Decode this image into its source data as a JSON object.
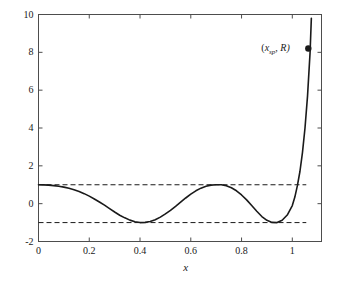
{
  "chart_data": {
    "type": "line",
    "title": "",
    "subtitle": "",
    "xlabel": "x",
    "ylabel": "",
    "xlim": [
      0,
      1.115
    ],
    "ylim": [
      -2,
      10
    ],
    "grid": false,
    "legend": null,
    "xticks": [
      0,
      0.2,
      0.4,
      0.6,
      0.8,
      1
    ],
    "xtick_labels": [
      "0",
      "0.2",
      "0.4",
      "0.6",
      "0.8",
      "1"
    ],
    "yticks": [
      -2,
      0,
      2,
      4,
      6,
      8,
      10
    ],
    "ytick_labels": [
      "-2",
      "0",
      "2",
      "4",
      "6",
      "8",
      "10"
    ],
    "series": [
      {
        "name": "curve",
        "style": "solid",
        "color": "#1a1a1a",
        "x": [
          0.0,
          0.02,
          0.04,
          0.06,
          0.08,
          0.1,
          0.12,
          0.14,
          0.16,
          0.18,
          0.2,
          0.22,
          0.24,
          0.26,
          0.28,
          0.3,
          0.32,
          0.34,
          0.36,
          0.38,
          0.4,
          0.42,
          0.44,
          0.46,
          0.48,
          0.5,
          0.52,
          0.54,
          0.56,
          0.58,
          0.6,
          0.62,
          0.64,
          0.66,
          0.68,
          0.7,
          0.72,
          0.74,
          0.76,
          0.78,
          0.8,
          0.82,
          0.84,
          0.86,
          0.88,
          0.9,
          0.92,
          0.94,
          0.96,
          0.98,
          1.0,
          1.01,
          1.02,
          1.03,
          1.04,
          1.05,
          1.06,
          1.07,
          1.075
        ],
        "y": [
          1.0,
          0.995,
          0.98,
          0.955,
          0.92,
          0.875,
          0.815,
          0.74,
          0.645,
          0.53,
          0.4,
          0.25,
          0.09,
          -0.08,
          -0.26,
          -0.44,
          -0.61,
          -0.75,
          -0.87,
          -0.96,
          -1.0,
          -0.99,
          -0.94,
          -0.85,
          -0.71,
          -0.54,
          -0.35,
          -0.14,
          0.08,
          0.3,
          0.5,
          0.68,
          0.82,
          0.92,
          0.98,
          1.0,
          1.0,
          0.95,
          0.84,
          0.68,
          0.46,
          0.2,
          -0.1,
          -0.4,
          -0.68,
          -0.88,
          -0.99,
          -1.0,
          -0.88,
          -0.6,
          -0.1,
          0.35,
          0.95,
          1.7,
          2.7,
          4.0,
          5.7,
          8.0,
          9.8
        ]
      },
      {
        "name": "upper-bound",
        "style": "dashed",
        "color": "#1a1a1a",
        "y_constant": 1,
        "x_range": [
          0,
          1.055
        ]
      },
      {
        "name": "lower-bound",
        "style": "dashed",
        "color": "#1a1a1a",
        "y_constant": -1,
        "x_range": [
          0,
          1.055
        ]
      }
    ],
    "annotations": [
      {
        "name": "setpoint-marker",
        "label_prefix": "(",
        "label_var": "x",
        "label_sub": "sp",
        "label_suffix": ", R)",
        "marker": "filled-circle",
        "x": 1.063,
        "y": 8.2
      }
    ]
  },
  "axes": {
    "x_title": "x",
    "y_title": ""
  }
}
